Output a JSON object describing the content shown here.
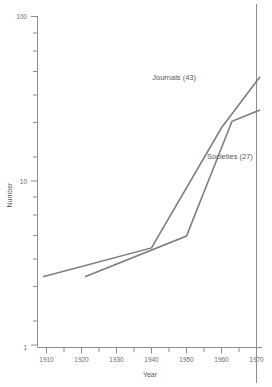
{
  "chart_data": {
    "type": "line",
    "title": "",
    "xlabel": "Year",
    "ylabel": "Number",
    "yscale": "log",
    "ylim": [
      1,
      100
    ],
    "xlim": [
      1905,
      1972
    ],
    "grid": false,
    "legend_position": "inline-annotation",
    "y_tick_labels": [
      "100",
      "10",
      "1"
    ],
    "y_tick_values": [
      100,
      10,
      1
    ],
    "x_tick_labels": [
      "1910",
      "1920",
      "1930",
      "1940",
      "1950",
      "1960",
      "1970"
    ],
    "x_tick_values": [
      1910,
      1920,
      1930,
      1940,
      1950,
      1960,
      1970
    ],
    "x_minor_tick_values": [
      1915,
      1925,
      1935,
      1945,
      1955,
      1965
    ],
    "series": [
      {
        "name": "Journals",
        "label": "Journals  (43)",
        "final_value": 43,
        "x": [
          1909,
          1940,
          1960,
          1971
        ],
        "values": [
          2.6,
          3.9,
          21,
          43
        ]
      },
      {
        "name": "Societies",
        "label": "Societies  (27)",
        "final_value": 27,
        "x": [
          1921,
          1950,
          1963,
          1971
        ],
        "values": [
          2.6,
          4.6,
          23,
          27
        ]
      }
    ],
    "annotations": [
      {
        "text": "Journals  (43)",
        "series": "Journals"
      },
      {
        "text": "Societies  (27)",
        "series": "Societies"
      }
    ],
    "colors": {
      "line": "#7e7e80",
      "axis": "#8d8d8f",
      "text": "#58585a",
      "background": "#ffffff"
    }
  }
}
